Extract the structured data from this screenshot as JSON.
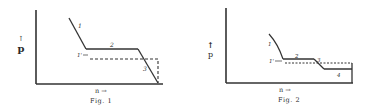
{
  "figures": [
    {
      "id": "fig1",
      "caption": "Fig. 1",
      "y_axis_label": "p",
      "x_axis_label": "n →",
      "curve_labels": {
        "c1": "1",
        "c1prime": "1'",
        "c2": "2",
        "c3": "3"
      }
    },
    {
      "id": "fig2",
      "caption": "Fig. 2",
      "y_axis_label": "p",
      "x_axis_label": "n →",
      "curve_labels": {
        "c1": "1",
        "c1prime": "1'",
        "c2": "2",
        "c3": "3",
        "c4": "4"
      }
    }
  ],
  "colors": {
    "ink": "#2a2a2a",
    "background": "#ffffff"
  }
}
